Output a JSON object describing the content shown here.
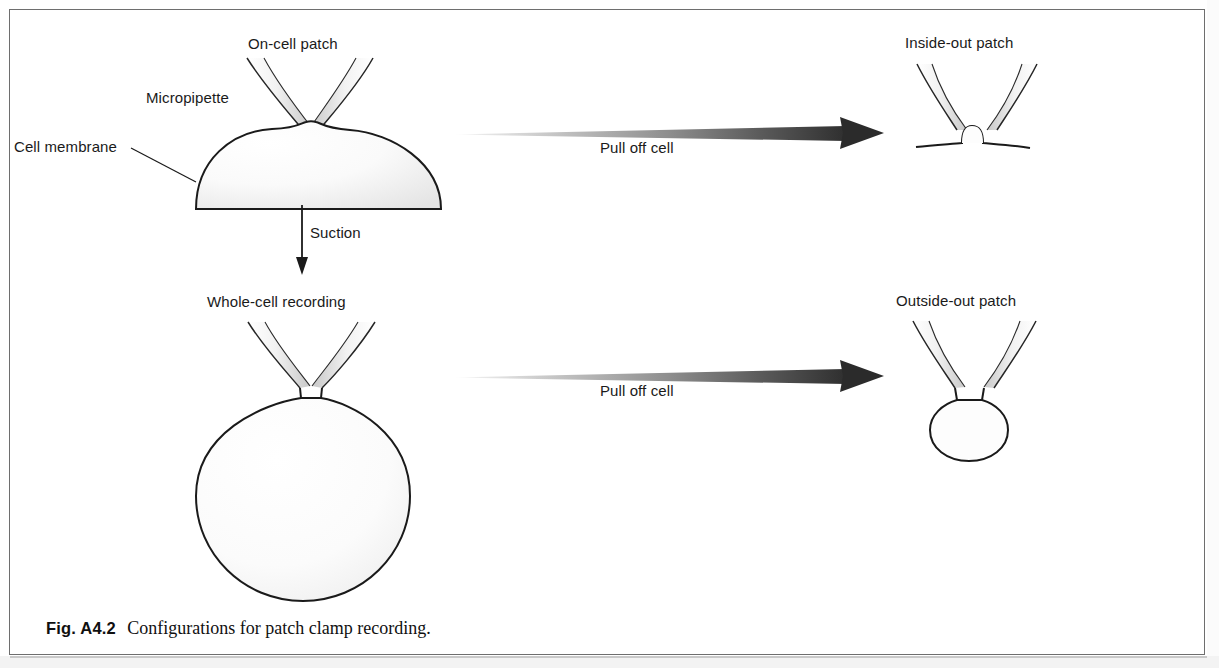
{
  "figure": {
    "caption_number": "Fig. A4.2",
    "caption_text": "Configurations for patch clamp recording."
  },
  "labels": {
    "on_cell_patch": "On-cell patch",
    "micropipette": "Micropipette",
    "cell_membrane": "Cell membrane",
    "suction": "Suction",
    "whole_cell_recording": "Whole-cell recording",
    "inside_out_patch": "Inside-out patch",
    "outside_out_patch": "Outside-out patch",
    "pull_off_cell_top": "Pull off cell",
    "pull_off_cell_bottom": "Pull off cell"
  },
  "diagram": {
    "type": "scientific-schematic",
    "panels": [
      {
        "id": "on-cell-patch",
        "title": "On-cell patch",
        "description": "Micropipette tip sealed onto the intact cell membrane dome",
        "annotations": [
          "Micropipette",
          "Cell membrane"
        ]
      },
      {
        "id": "whole-cell-recording",
        "title": "Whole-cell recording",
        "description": "Membrane patch ruptured by suction; pipette interior continuous with cell cytoplasm",
        "annotations": []
      },
      {
        "id": "inside-out-patch",
        "title": "Inside-out patch",
        "description": "Excised membrane patch with cytoplasmic face outward, small vesicle at pipette tip",
        "annotations": []
      },
      {
        "id": "outside-out-patch",
        "title": "Outside-out patch",
        "description": "Excised membrane vesicle with extracellular face outward, sphere sealed across pipette tip",
        "annotations": []
      }
    ],
    "transitions": [
      {
        "id": "suction",
        "label": "Suction",
        "from": "on-cell-patch",
        "to": "whole-cell-recording",
        "direction": "down"
      },
      {
        "id": "pull-off-cell-top",
        "label": "Pull off cell",
        "from": "on-cell-patch",
        "to": "inside-out-patch",
        "direction": "right"
      },
      {
        "id": "pull-off-cell-bottom",
        "label": "Pull off cell",
        "from": "whole-cell-recording",
        "to": "outside-out-patch",
        "direction": "right"
      }
    ]
  },
  "colors": {
    "outline": "#1a1a1a",
    "glass_fill_light": "#f7f7f7",
    "glass_fill_shade": "#d0d0d0",
    "arrow_dark": "#3a3a3a",
    "frame": "#6e6e6e",
    "background": "#ffffff"
  }
}
